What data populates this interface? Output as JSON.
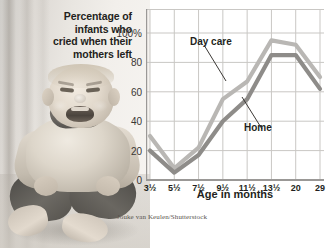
{
  "caption": {
    "lines": [
      "Percentage of",
      "infants who",
      "cried when their",
      "mothers left"
    ]
  },
  "photo": {
    "alt_name": "crying-infant-photo",
    "description": "Black and white photograph of a crying infant seated on the floor"
  },
  "credit": {
    "text": "Jouke van Keulen/Shutterstock"
  },
  "series_labels": {
    "day_care": "Day care",
    "home": "Home"
  },
  "colors": {
    "day_care_line": "#b9b7b4",
    "home_line": "#8e8c89",
    "grid": "#c9c7c4",
    "axis": "#9a9896",
    "text": "#231f20"
  },
  "chart_data": {
    "type": "line",
    "title": "Percentage of infants who cried when their mothers left",
    "xlabel": "Age in months",
    "ylabel": "",
    "categories": [
      "3½",
      "5½",
      "7½",
      "9½",
      "11½",
      "13½",
      "20",
      "29"
    ],
    "ylim": [
      0,
      100
    ],
    "yticks": [
      "0",
      "20",
      "40",
      "60",
      "80",
      "100%"
    ],
    "ytick_values": [
      0,
      20,
      40,
      60,
      80,
      100
    ],
    "grid": true,
    "legend_position": "inline-annotations",
    "axis_breaks": [
      "between 13½ and 20",
      "between 20 and 29"
    ],
    "series": [
      {
        "name": "Day care",
        "values": [
          30,
          8,
          22,
          55,
          67,
          95,
          92,
          70
        ]
      },
      {
        "name": "Home",
        "values": [
          20,
          5,
          17,
          40,
          55,
          85,
          85,
          62
        ]
      }
    ]
  }
}
